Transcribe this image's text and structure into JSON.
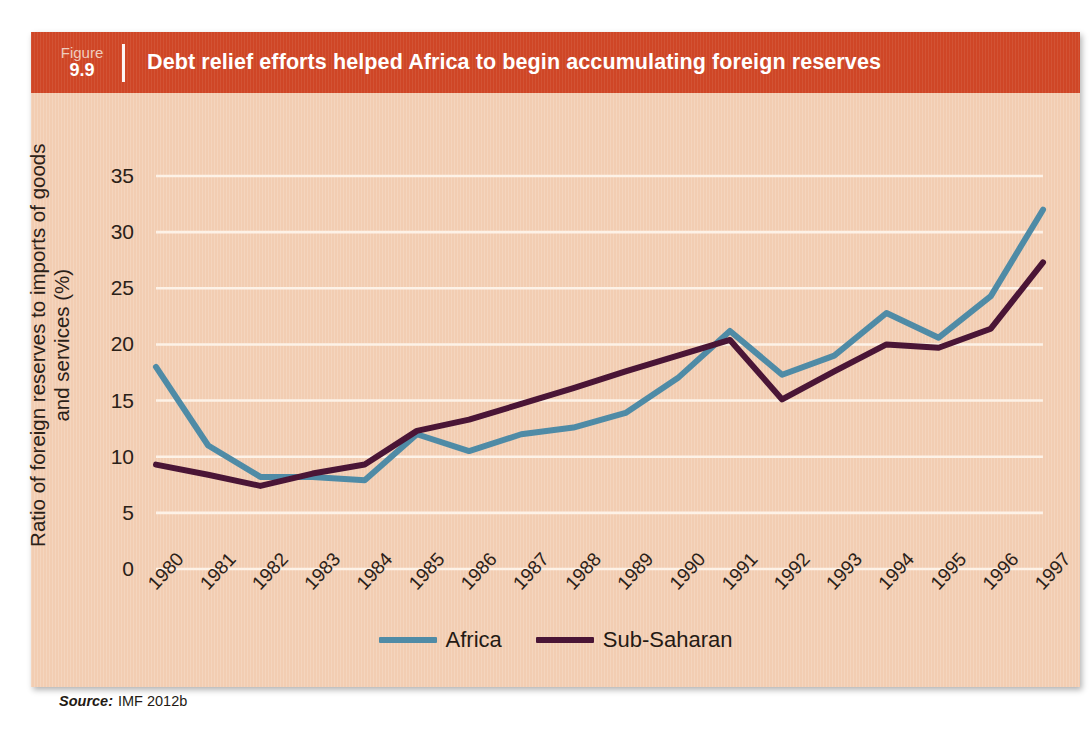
{
  "figure": {
    "label_word": "Figure",
    "number": "9.9",
    "title": "Debt relief efforts helped Africa to begin accumulating foreign reserves",
    "banner_color": "#cf4626",
    "panel_color": "#f2cdb2"
  },
  "source": {
    "label": "Source:",
    "text": "IMF 2012b"
  },
  "legend": {
    "position": "bottom-center",
    "items": [
      {
        "name": "Africa",
        "color": "#4f8ba6"
      },
      {
        "name": "Sub-Saharan",
        "color": "#4a1536"
      }
    ]
  },
  "chart_data": {
    "type": "line",
    "title": "Debt relief efforts helped Africa to begin accumulating foreign reserves",
    "xlabel": "",
    "ylabel": "Ratio of foreign reserves to imports of goods and services (%)",
    "ylabel_line1": "Ratio of foreign reserves to imports of goods",
    "ylabel_line2": "and services (%)",
    "categories": [
      "1980",
      "1981",
      "1982",
      "1983",
      "1984",
      "1985",
      "1986",
      "1987",
      "1988",
      "1989",
      "1990",
      "1991",
      "1992",
      "1993",
      "1994",
      "1995",
      "1996",
      "1997"
    ],
    "yticks": [
      0,
      5,
      10,
      15,
      20,
      25,
      30,
      35
    ],
    "ylim": [
      0,
      35
    ],
    "grid": true,
    "gridline_color": "#fdf2e7",
    "series": [
      {
        "name": "Africa",
        "color": "#4f8ba6",
        "values": [
          18.0,
          11.0,
          8.2,
          8.2,
          7.9,
          12.0,
          10.5,
          12.0,
          12.6,
          13.9,
          17.0,
          21.2,
          17.3,
          19.0,
          22.8,
          20.6,
          24.3,
          32.0
        ]
      },
      {
        "name": "Sub-Saharan",
        "color": "#4a1536",
        "values": [
          9.3,
          8.4,
          7.4,
          8.5,
          9.3,
          12.3,
          13.3,
          14.7,
          16.1,
          17.6,
          19.0,
          20.4,
          15.1,
          17.6,
          20.0,
          19.7,
          21.4,
          27.3
        ]
      }
    ]
  }
}
